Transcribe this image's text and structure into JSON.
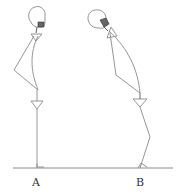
{
  "diagram": {
    "stroke_color": "#8a8a8a",
    "dark_color": "#333333",
    "background": "#ffffff",
    "figures": [
      {
        "id": "A",
        "label": "A",
        "posture": "upright"
      },
      {
        "id": "B",
        "label": "B",
        "posture": "stooped forward"
      }
    ]
  }
}
